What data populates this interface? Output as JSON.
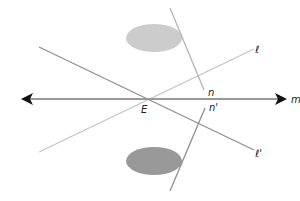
{
  "diagram": {
    "type": "geometry-transversal-reflection",
    "colors": {
      "line_m": "#999999",
      "line_l": "#c4c4c4",
      "line_l_prime": "#8f8f8f",
      "line_n": "#b5b5b5",
      "line_n_prime": "#8f8f8f",
      "ellipse_upper": "#cccccc",
      "ellipse_lower": "#999999",
      "arrow": "#111111",
      "label": "#222222"
    },
    "labels": {
      "m": "m",
      "E": "E",
      "l": "ℓ",
      "l_prime": "ℓ'",
      "n": "n",
      "n_prime": "n'"
    },
    "lines": [
      {
        "id": "m",
        "x1": 22,
        "y1": 99,
        "x2": 286,
        "y2": 99,
        "arrows": "both"
      },
      {
        "id": "l",
        "x1": 39,
        "y1": 152,
        "x2": 254,
        "y2": 49
      },
      {
        "id": "l_prime",
        "x1": 39,
        "y1": 47,
        "x2": 254,
        "y2": 150
      },
      {
        "id": "n",
        "x1": 170,
        "y1": 8,
        "x2": 204,
        "y2": 90
      },
      {
        "id": "n_prime",
        "x1": 205,
        "y1": 108,
        "x2": 170,
        "y2": 191
      }
    ],
    "shapes": [
      {
        "id": "ellipse_upper",
        "cx": 154,
        "cy": 38,
        "rx": 28,
        "ry": 14
      },
      {
        "id": "ellipse_lower",
        "cx": 154,
        "cy": 161,
        "rx": 28,
        "ry": 14
      }
    ],
    "point_E": {
      "x": 145,
      "y": 99
    }
  }
}
